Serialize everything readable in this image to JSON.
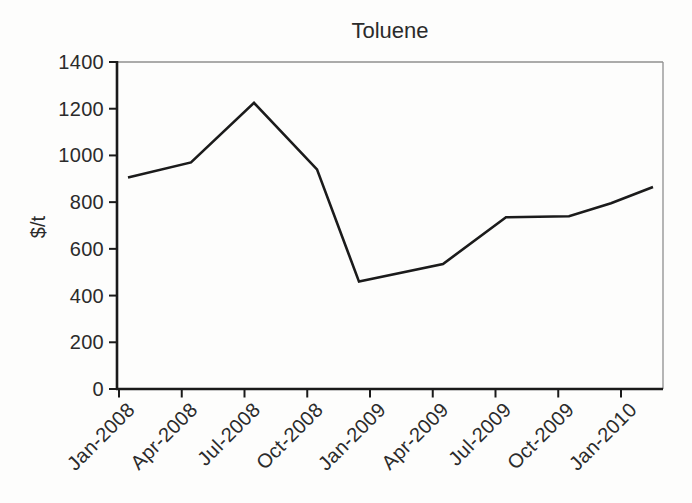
{
  "chart_data": {
    "type": "line",
    "title": "Toluene",
    "xlabel": "",
    "ylabel": "$/t",
    "ylim": [
      0,
      1400
    ],
    "grid": false,
    "legend": "none",
    "line_color": "#1b1b1b",
    "frame_color": "#8f8f8f",
    "axis_color": "#1a1a1a",
    "y_ticks": [
      1400,
      1200,
      1000,
      800,
      600,
      400,
      200,
      0
    ],
    "x_tick_labels": [
      "Jan-2008",
      "Apr-2008",
      "Jul-2008",
      "Oct-2008",
      "Jan-2009",
      "Apr-2009",
      "Jul-2009",
      "Oct-2009",
      "Jan-2010"
    ],
    "series": [
      {
        "name": "Toluene price",
        "unit": "$/t",
        "points": [
          {
            "month": "Jan-2008",
            "month_index": 0,
            "value": 905
          },
          {
            "month": "Apr-2008",
            "month_index": 3,
            "value": 970
          },
          {
            "month": "Jul-2008",
            "month_index": 6,
            "value": 1225
          },
          {
            "month": "Oct-2008",
            "month_index": 9,
            "value": 940
          },
          {
            "month": "Dec-2008",
            "month_index": 11,
            "value": 460
          },
          {
            "month": "Apr-2009",
            "month_index": 15,
            "value": 535
          },
          {
            "month": "Jul-2009",
            "month_index": 18,
            "value": 735
          },
          {
            "month": "Oct-2009",
            "month_index": 21,
            "value": 740
          },
          {
            "month": "Dec-2009",
            "month_index": 23,
            "value": 795
          },
          {
            "month": "Feb-2010",
            "month_index": 25,
            "value": 865
          }
        ]
      }
    ]
  }
}
